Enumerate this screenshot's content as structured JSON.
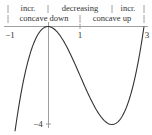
{
  "header": {
    "row1": {
      "left": "incr.",
      "middle": "decreasing",
      "right": "incr."
    },
    "row2": {
      "left": "concave down",
      "right": "concave up"
    }
  },
  "axes": {
    "x_labels": [
      "−1",
      "1",
      "3"
    ],
    "y_labels": [
      "−4"
    ]
  },
  "function": "x^3 - 3x^2",
  "colors": {
    "curve": "#333333",
    "axis": "#888888",
    "text": "#333333"
  }
}
